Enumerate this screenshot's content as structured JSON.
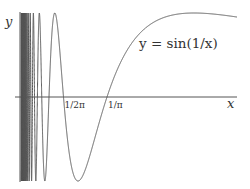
{
  "chart_data": {
    "type": "line",
    "title": "",
    "function": "sin(1/x)",
    "curve_label": "y = sin(1/x)",
    "xlabel": "x",
    "ylabel": "y",
    "xlim": [
      0,
      0.794
    ],
    "ylim": [
      -1,
      1
    ],
    "grid": false,
    "x_tick_labels": [
      {
        "value": 0.15915,
        "label": "1/2π"
      },
      {
        "value": 0.31831,
        "label": "1/π"
      }
    ],
    "series": [
      {
        "name": "y = sin(1/x)",
        "x_range": [
          0.005,
          0.794
        ]
      }
    ]
  },
  "colors": {
    "line": "#555555",
    "axis": "#555555",
    "text": "#333333",
    "background": "#ffffff"
  }
}
